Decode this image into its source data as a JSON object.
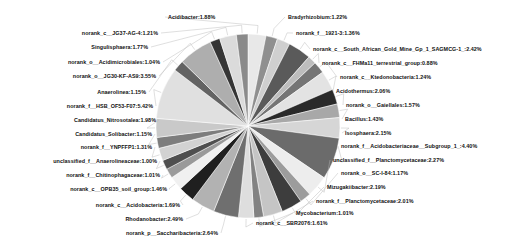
{
  "chart_data": {
    "type": "pie",
    "title": "",
    "legend": "none",
    "grid": false,
    "units": "%",
    "categories": [
      "Acidibacter",
      "Bradyrhizobium",
      "norank_f__1921-3",
      "norank_c__South_African_Gold_Mine_Gp_1_SAGMCG-1_",
      "norank_c__FHMa11_terrestrial_group",
      "norank_c__Ktedonobacteria",
      "Acidothermus",
      "norank_o__Gaiellales",
      "Bacillus",
      "Isosphaera",
      "norank_f__Acidobacteriaceae__Subgroup_1_",
      "unclassified_f__Planctomycetaceae",
      "norank_o__SC-I-84",
      "Mizugakiibacter",
      "norank_f__Planctomycetaceae",
      "Mycobacterium",
      "norank_c__SBR2076",
      "norank_p__Saccharibacteria",
      "Rhodanobacter",
      "norank_c__Acidobacteria",
      "norank_c__OPB35_soil_group",
      "norank_f__Chitinophagaceae",
      "unclassified_f__Anaerolineaceae",
      "norank_f__YNPFFP1",
      "Candidatus_Solibacter",
      "Candidatus_Nitrosotalea",
      "norank_f__HSB_OF53-F07",
      "Anaerolinea",
      "norank_o__JG30-KF-AS9",
      "norank_o__Acidimicrobiales",
      "Singulisphaera",
      "norank_c__JG37-AG-4"
    ],
    "values": [
      1.88,
      1.22,
      1.36,
      2.42,
      0.88,
      1.24,
      2.06,
      1.57,
      1.43,
      2.15,
      4.4,
      2.27,
      1.17,
      2.19,
      2.01,
      1.01,
      1.61,
      2.64,
      2.49,
      1.69,
      1.46,
      1.01,
      1.0,
      1.31,
      1.15,
      1.98,
      5.42,
      1.15,
      3.55,
      1.04,
      1.77,
      1.21
    ],
    "labels": [
      "Acidibacter:1.88%",
      "Bradyrhizobium:1.22%",
      "norank_f__1921-3:1.36%",
      "norank_c__South_African_Gold_Mine_Gp_1_SAGMCG-1_:2.42%",
      "norank_c__FHMa11_terrestrial_group:0.88%",
      "norank_c__Ktedonobacteria:1.24%",
      "Acidothermus:2.06%",
      "norank_o__Gaiellales:1.57%",
      "Bacillus:1.43%",
      "Isosphaera:2.15%",
      "norank_f__Acidobacteriaceae__Subgroup_1_:4.40%",
      "unclassified_f__Planctomycetaceae:2.27%",
      "norank_o__SC-I-84:1.17%",
      "Mizugakiibacter:2.19%",
      "norank_f__Planctomycetaceae:2.01%",
      "Mycobacterium:1.01%",
      "norank_c__SBR2076:1.61%",
      "norank_p__Saccharibacteria:2.64%",
      "Rhodanobacter:2.49%",
      "norank_c__Acidobacteria:1.69%",
      "norank_c__OPB35_soil_group:1.46%",
      "norank_f__Chitinophagaceae:1.01%",
      "unclassified_f__Anaerolineaceae:1.00%",
      "norank_f__YNPFFP1:1.31%",
      "Candidatus_Solibacter:1.15%",
      "Candidatus_Nitrosotalea:1.98%",
      "norank_f__HSB_OF53-F07:5.42%",
      "Anaerolinea:1.15%",
      "norank_o__JG30-KF-AS9:3.55%",
      "norank_o__Acidimicrobiales:1.04%",
      "Singulisphaera:1.77%",
      "norank_c__JG37-AG-4:1.21%"
    ],
    "colors": [
      "#e8e8e8",
      "#8f8f8f",
      "#cfcfcf",
      "#5a5a5a",
      "#bdbdbd",
      "#757575",
      "#e3e3e3",
      "#2a2a2a",
      "#a8a8a8",
      "#d6d6d6",
      "#6b6b6b",
      "#ededed",
      "#9c9c9c",
      "#3d3d3d",
      "#c5c5c5",
      "#828282",
      "#dedede",
      "#6f6f6f",
      "#b2b2b2",
      "#1f1f1f",
      "#f0f0f0",
      "#9a9a9a",
      "#4f4f4f",
      "#d2d2d2",
      "#7d7d7d",
      "#c9c9c9",
      "#e0e0e0",
      "#636363",
      "#aeaeae",
      "#353535",
      "#dbdbdb",
      "#8a8a8a"
    ],
    "label_positions": [
      {
        "x": 168,
        "y": 14,
        "side": "r"
      },
      {
        "x": 288,
        "y": 14,
        "side": "r"
      },
      {
        "x": 296,
        "y": 30,
        "side": "r"
      },
      {
        "x": 313,
        "y": 46,
        "side": "r"
      },
      {
        "x": 322,
        "y": 60,
        "side": "r"
      },
      {
        "x": 340,
        "y": 74,
        "side": "r"
      },
      {
        "x": 336,
        "y": 88,
        "side": "r"
      },
      {
        "x": 346,
        "y": 102,
        "side": "r"
      },
      {
        "x": 345,
        "y": 116,
        "side": "r"
      },
      {
        "x": 345,
        "y": 130,
        "side": "r"
      },
      {
        "x": 341,
        "y": 143,
        "side": "r"
      },
      {
        "x": 333,
        "y": 157,
        "side": "r"
      },
      {
        "x": 341,
        "y": 170,
        "side": "r"
      },
      {
        "x": 327,
        "y": 184,
        "side": "r"
      },
      {
        "x": 316,
        "y": 198,
        "side": "r"
      },
      {
        "x": 296,
        "y": 210,
        "side": "r"
      },
      {
        "x": 256,
        "y": 220,
        "side": "r"
      },
      {
        "x": 218,
        "y": 230,
        "side": "l"
      },
      {
        "x": 183,
        "y": 216,
        "side": "l"
      },
      {
        "x": 180,
        "y": 202,
        "side": "l"
      },
      {
        "x": 167,
        "y": 186,
        "side": "l"
      },
      {
        "x": 160,
        "y": 172,
        "side": "l"
      },
      {
        "x": 157,
        "y": 158,
        "side": "l"
      },
      {
        "x": 152,
        "y": 144,
        "side": "l"
      },
      {
        "x": 152,
        "y": 131,
        "side": "l"
      },
      {
        "x": 156,
        "y": 117,
        "side": "l"
      },
      {
        "x": 153,
        "y": 103,
        "side": "l"
      },
      {
        "x": 146,
        "y": 89,
        "side": "l"
      },
      {
        "x": 156,
        "y": 73,
        "side": "l"
      },
      {
        "x": 160,
        "y": 59,
        "side": "l"
      },
      {
        "x": 148,
        "y": 44,
        "side": "l"
      },
      {
        "x": 158,
        "y": 30,
        "side": "l"
      }
    ]
  }
}
